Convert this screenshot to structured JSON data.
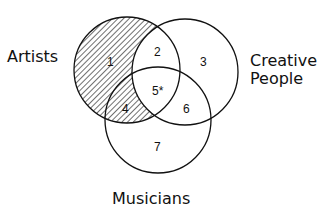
{
  "diagram": {
    "corner_mark": "a.",
    "sets": [
      {
        "name": "Artists",
        "shaded": true
      },
      {
        "name": "Creative",
        "name_line2": "People",
        "shaded": false
      },
      {
        "name": "Musicians",
        "shaded": false
      }
    ],
    "regions": [
      "1",
      "2",
      "3",
      "4",
      "5*",
      "6",
      "7"
    ]
  }
}
